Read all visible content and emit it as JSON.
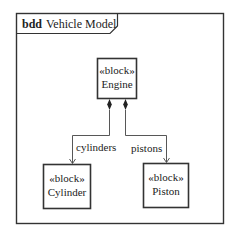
{
  "diagram": {
    "kind": "bdd",
    "name": "Vehicle Model",
    "blocks": [
      {
        "id": "engine",
        "stereotype": "«block»",
        "name": "Engine"
      },
      {
        "id": "cylinder",
        "stereotype": "«block»",
        "name": "Cylinder"
      },
      {
        "id": "piston",
        "stereotype": "«block»",
        "name": "Piston"
      }
    ],
    "associations": [
      {
        "type": "composition",
        "from": "Engine",
        "to": "Cylinder",
        "role": "cylinders"
      },
      {
        "type": "composition",
        "from": "Engine",
        "to": "Piston",
        "role": "pistons"
      }
    ]
  }
}
